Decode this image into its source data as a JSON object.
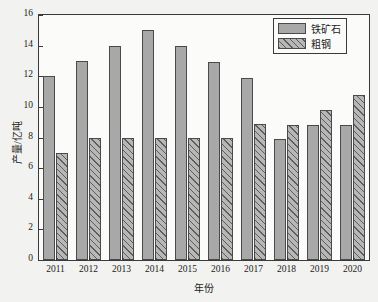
{
  "chart_data": {
    "type": "bar",
    "title": "",
    "xlabel": "年份",
    "ylabel": "产量/亿吨",
    "categories": [
      "2011",
      "2012",
      "2013",
      "2014",
      "2015",
      "2016",
      "2017",
      "2018",
      "2019",
      "2020"
    ],
    "series": [
      {
        "name": "铁矿石",
        "values": [
          12.0,
          13.0,
          14.0,
          15.0,
          14.0,
          12.9,
          11.9,
          7.9,
          8.8,
          8.8
        ],
        "fill": "#a8a8a8",
        "pattern": "solid"
      },
      {
        "name": "粗钢",
        "values": [
          7.0,
          8.0,
          8.0,
          8.0,
          8.0,
          8.0,
          8.9,
          8.8,
          9.8,
          10.8
        ],
        "fill": "#b7b7b7",
        "pattern": "diagonal-hatch"
      }
    ],
    "ylim": [
      0,
      16
    ],
    "yticks": [
      0,
      2,
      4,
      6,
      8,
      10,
      12,
      14,
      16
    ],
    "ytick_labels": [
      "0",
      "2",
      "4",
      "6",
      "8",
      "10",
      "12",
      "14",
      "16"
    ],
    "grid": false,
    "legend_position": "top-right",
    "axis_color": "#3a3a3a",
    "background_color": "#f2f2f0",
    "plot_background_color": "#fbfbfa"
  }
}
